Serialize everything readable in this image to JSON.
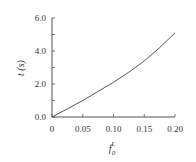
{
  "chart_data": {
    "type": "line",
    "title": "",
    "xlabel": "f_0^L",
    "xlabel_main": "f",
    "xlabel_sub": "0",
    "xlabel_sup": "L",
    "ylabel": "t (s)",
    "xlim": [
      0,
      0.2
    ],
    "ylim": [
      0.0,
      6.0
    ],
    "xticks": [
      "0",
      "0.05",
      "0.10",
      "0.15",
      "0.20"
    ],
    "yticks": [
      "0.0",
      "2.0",
      "4.0",
      "6.0"
    ],
    "grid": false,
    "series": [
      {
        "name": "t",
        "x": [
          0,
          0.025,
          0.05,
          0.075,
          0.1,
          0.125,
          0.15,
          0.175,
          0.2
        ],
        "values": [
          0.0,
          0.5,
          1.0,
          1.55,
          2.1,
          2.72,
          3.4,
          4.2,
          5.1
        ]
      }
    ],
    "colors": {
      "line": "#555555",
      "axis": "#555555"
    }
  }
}
